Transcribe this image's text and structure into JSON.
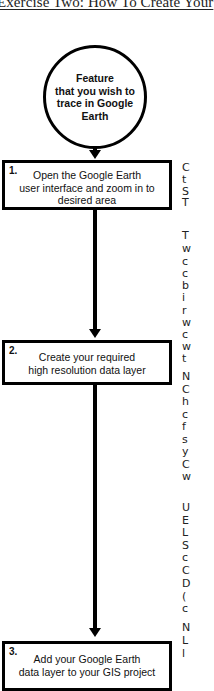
{
  "title": "Exercise Two: How To Create Your",
  "start_node": {
    "text": "Feature that you wish to trace in Google Earth",
    "lines": [
      "Feature",
      "that you wish to",
      "trace in Google",
      "Earth"
    ]
  },
  "steps": [
    {
      "number": "1.",
      "lines": [
        "Open the Google Earth",
        "user interface and zoom in to",
        "desired area"
      ]
    },
    {
      "number": "2.",
      "lines": [
        "Create your required",
        "high resolution data layer"
      ]
    },
    {
      "number": "3.",
      "lines": [
        "Add your Google Earth",
        "data layer to your GIS project"
      ]
    }
  ],
  "side_text_fragments": [
    {
      "char": "C",
      "y": 162
    },
    {
      "char": "t",
      "y": 174
    },
    {
      "char": "S",
      "y": 186
    },
    {
      "char": "T",
      "y": 197
    },
    {
      "char": "T",
      "y": 230
    },
    {
      "char": "w",
      "y": 243
    },
    {
      "char": "c",
      "y": 256
    },
    {
      "char": "c",
      "y": 268
    },
    {
      "char": "b",
      "y": 280
    },
    {
      "char": "i",
      "y": 292
    },
    {
      "char": "r",
      "y": 305
    },
    {
      "char": "w",
      "y": 317
    },
    {
      "char": "c",
      "y": 329
    },
    {
      "char": "w",
      "y": 341
    },
    {
      "char": "t",
      "y": 353
    },
    {
      "char": "N",
      "y": 371
    },
    {
      "char": "C",
      "y": 384
    },
    {
      "char": "h",
      "y": 396
    },
    {
      "char": "c",
      "y": 409
    },
    {
      "char": "f",
      "y": 421
    },
    {
      "char": "s",
      "y": 434
    },
    {
      "char": "y",
      "y": 446
    },
    {
      "char": "C",
      "y": 459
    },
    {
      "char": "w",
      "y": 471
    },
    {
      "char": "U",
      "y": 502
    },
    {
      "char": "E",
      "y": 515
    },
    {
      "char": "L",
      "y": 527
    },
    {
      "char": "S",
      "y": 540
    },
    {
      "char": "c",
      "y": 552
    },
    {
      "char": "C",
      "y": 565
    },
    {
      "char": "D",
      "y": 578
    },
    {
      "char": "(",
      "y": 591
    },
    {
      "char": "c",
      "y": 603
    },
    {
      "char": "N",
      "y": 622
    },
    {
      "char": "L",
      "y": 635
    },
    {
      "char": "l",
      "y": 648
    }
  ]
}
